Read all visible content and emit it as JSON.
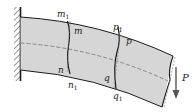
{
  "figure": {
    "type": "cantilever-beam-deformation",
    "colors": {
      "beam_fill": "#d6d6d6",
      "outline": "#1a1a1a",
      "dashed": "#666666",
      "background": "#ffffff"
    },
    "labels": {
      "m1": "m",
      "m1_sub": "1",
      "m": "m",
      "n": "n",
      "n1": "n",
      "n1_sub": "1",
      "p1": "p",
      "p1_sub": "1",
      "p": "p",
      "q": "q",
      "q1": "q",
      "q1_sub": "1",
      "load": "P"
    }
  }
}
